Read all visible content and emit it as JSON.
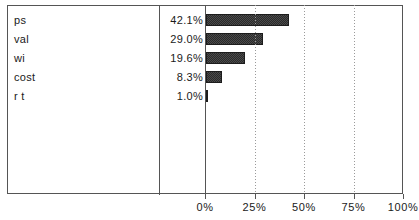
{
  "chart_data": {
    "type": "bar",
    "orientation": "horizontal",
    "title": "",
    "xlabel": "",
    "ylabel": "",
    "categories": [
      "ps",
      "val",
      "wi",
      "cost",
      "r t"
    ],
    "values": [
      42.1,
      29.0,
      19.6,
      8.3,
      1.0
    ],
    "value_labels": [
      "42.1%",
      "29.0%",
      "19.6%",
      "8.3%",
      "1.0%"
    ],
    "xlim": [
      0,
      100
    ],
    "xticks": [
      0,
      25,
      50,
      75,
      100
    ],
    "xtick_labels": [
      "0%",
      "25%",
      "50%",
      "75%",
      "100%"
    ],
    "grid": "vertical-dotted",
    "legend": "none",
    "bar_color": "#3a3a3a",
    "bar_edge_color": "#1c1c1c",
    "frame_color": "#555555",
    "gridline_color": "#9a9a9a",
    "text_color": "#1a1a1a"
  },
  "axis": {
    "ticks": [
      {
        "label": "0%",
        "value": 0
      },
      {
        "label": "25%",
        "value": 25
      },
      {
        "label": "50%",
        "value": 50
      },
      {
        "label": "75%",
        "value": 75
      },
      {
        "label": "100%",
        "value": 100
      }
    ]
  },
  "rows": [
    {
      "label": "ps",
      "value_label": "42.1%",
      "value": 42.1
    },
    {
      "label": "val",
      "value_label": "29.0%",
      "value": 29.0
    },
    {
      "label": "wi",
      "value_label": "19.6%",
      "value": 19.6
    },
    {
      "label": "cost",
      "value_label": "8.3%",
      "value": 8.3
    },
    {
      "label": "r t",
      "value_label": "1.0%",
      "value": 1.0
    }
  ]
}
